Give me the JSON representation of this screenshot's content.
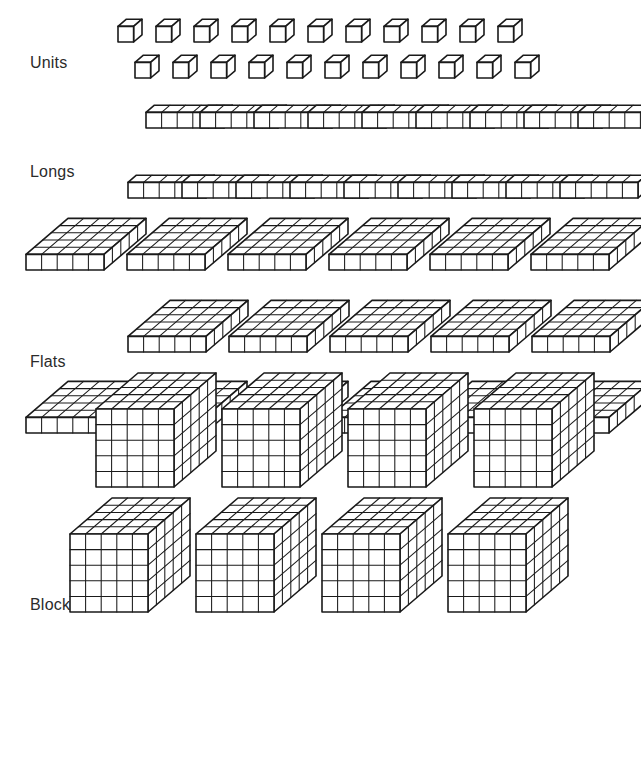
{
  "page": {
    "background_color": "#ffffff",
    "ink_color": "#1a1a1a",
    "width": 641,
    "height": 757
  },
  "rows": [
    {
      "key": "units",
      "label": "Units",
      "label_x": 30,
      "label_y": 54,
      "piece_type": "unit-cube",
      "dims": {
        "x": 1,
        "y": 1,
        "z": 1
      },
      "cubes_per_piece": 1,
      "lines": [
        {
          "count": 11,
          "start_x": 118,
          "y": 42,
          "step_x": 38
        },
        {
          "count": 11,
          "start_x": 135,
          "y": 78,
          "step_x": 38
        }
      ],
      "total_pieces": 22
    },
    {
      "key": "longs",
      "label": "Longs",
      "label_x": 30,
      "label_y": 163,
      "piece_type": "long-rod",
      "dims": {
        "x": 5,
        "y": 1,
        "z": 1
      },
      "cubes_per_piece": 5,
      "lines": [
        {
          "count": 9,
          "start_x": 146,
          "y": 128,
          "step_x": 54
        },
        {
          "count": 9,
          "start_x": 128,
          "y": 198,
          "step_x": 54
        }
      ],
      "total_pieces": 18
    },
    {
      "key": "flats",
      "label": "Flats",
      "label_x": 30,
      "label_y": 353,
      "piece_type": "flat-slab",
      "dims": {
        "x": 5,
        "y": 5,
        "z": 1
      },
      "cubes_per_piece": 25,
      "lines": [
        {
          "count": 6,
          "start_x": 26,
          "y": 270,
          "step_x": 101
        },
        {
          "count": 5,
          "start_x": 128,
          "y": 352,
          "step_x": 101
        },
        {
          "count": 6,
          "start_x": 26,
          "y": 433,
          "step_x": 101
        }
      ],
      "total_pieces": 17
    },
    {
      "key": "blocks",
      "label": "Blocks",
      "label_x": 30,
      "label_y": 596,
      "piece_type": "block-cube",
      "dims": {
        "x": 5,
        "y": 5,
        "z": 5
      },
      "cubes_per_piece": 125,
      "lines": [
        {
          "count": 4,
          "start_x": 96,
          "y": 487,
          "step_x": 126
        },
        {
          "count": 4,
          "start_x": 70,
          "y": 612,
          "step_x": 126
        }
      ],
      "total_pieces": 8
    }
  ],
  "geometry": {
    "unit_px": 15.6,
    "iso_dx": 8.4,
    "iso_dy": -7.2,
    "face_stroke_width": 1.6,
    "grid_stroke_width": 1.05
  }
}
